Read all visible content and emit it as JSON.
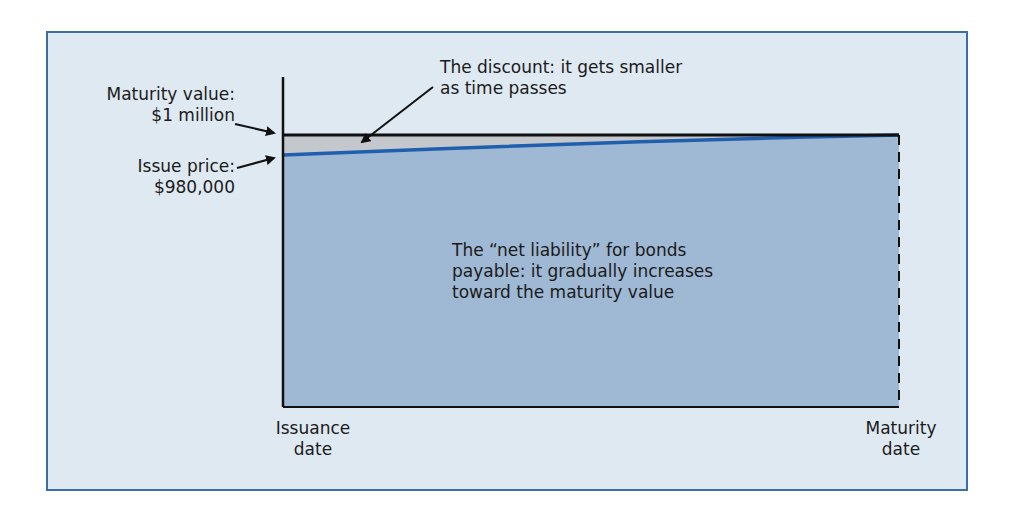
{
  "diagram": {
    "type": "bond-discount-amortization",
    "labels": {
      "maturity_value_line1": "Maturity value:",
      "maturity_value_line2": "$1 million",
      "issue_price_line1": "Issue price:",
      "issue_price_line2": "$980,000",
      "discount_line1": "The discount: it gets smaller",
      "discount_line2": "as time passes",
      "net_liability_line1": "The “net liability” for bonds",
      "net_liability_line2": "payable: it gradually increases",
      "net_liability_line3": "toward the maturity value",
      "issuance_line1": "Issuance",
      "issuance_line2": "date",
      "maturity_line1": "Maturity",
      "maturity_line2": "date"
    },
    "values": {
      "maturity_value": 1000000,
      "issue_price": 980000,
      "discount": 20000
    },
    "colors": {
      "frame_border": "#3a6ea5",
      "frame_bg": "#dfe9f1",
      "liability_fill": "#9fb8d4",
      "discount_fill": "#c4c8cc",
      "carrying_value_line": "#1f5fae",
      "maturity_line": "#111111"
    }
  }
}
